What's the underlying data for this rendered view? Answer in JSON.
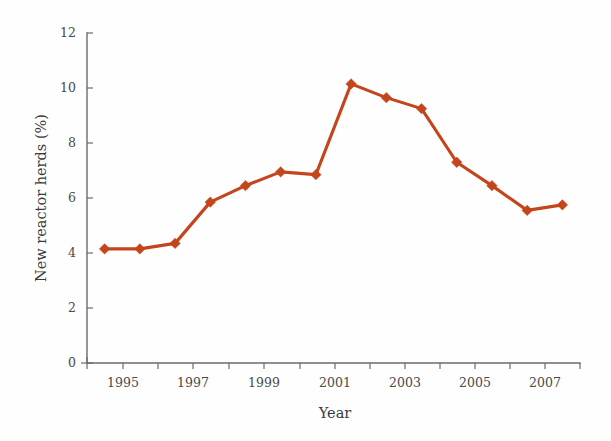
{
  "chart_data": {
    "type": "line",
    "title": "",
    "subtitle": "",
    "xlabel": "Year",
    "ylabel": "New reactor herds (%)",
    "xlim": [
      1994,
      2008
    ],
    "ylim": [
      0,
      12
    ],
    "grid": false,
    "legend": false,
    "legend_position": "none",
    "series_color": "#C4441B",
    "marker": "diamond",
    "x_tick_labels": [
      "1995",
      "1997",
      "1999",
      "2001",
      "2003",
      "2005",
      "2007"
    ],
    "x_tick_values": [
      1995,
      1997,
      1999,
      2001,
      2003,
      2005,
      2007
    ],
    "x_minor_tick_values": [
      1994,
      1996,
      1998,
      2000,
      2002,
      2004,
      2006,
      2008
    ],
    "y_tick_labels": [
      "0",
      "2",
      "4",
      "6",
      "8",
      "10",
      "12"
    ],
    "y_tick_values": [
      0,
      2,
      4,
      6,
      8,
      10,
      12
    ],
    "series": [
      {
        "name": "New reactor herds (%)",
        "x": [
          1994.5,
          1995.5,
          1996.5,
          1997.5,
          1998.5,
          1999.5,
          2000.5,
          2001.5,
          2002.5,
          2003.5,
          2004.5,
          2005.5,
          2006.5,
          2007.5
        ],
        "values": [
          4.15,
          4.15,
          4.35,
          5.85,
          6.45,
          6.95,
          6.85,
          10.15,
          9.65,
          9.25,
          7.3,
          6.45,
          5.55,
          5.75
        ]
      }
    ]
  },
  "axes": {
    "y_axis_label": "New reactor herds (%)",
    "x_axis_label": "Year"
  }
}
